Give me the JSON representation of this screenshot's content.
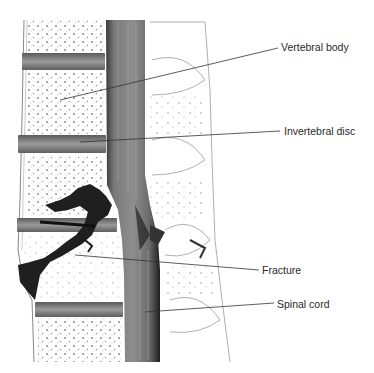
{
  "figure": {
    "labels": [
      {
        "id": "vertebral-body",
        "text": "Vertebral body",
        "x": 281,
        "y": 41
      },
      {
        "id": "invertebral-disc",
        "text": "Invertebral disc",
        "x": 284,
        "y": 125
      },
      {
        "id": "fracture",
        "text": "Fracture",
        "x": 262,
        "y": 264
      },
      {
        "id": "spinal-cord",
        "text": "Spinal cord",
        "x": 277,
        "y": 298
      }
    ],
    "colors": {
      "background": "#ffffff",
      "bone": "#fbfbfb",
      "disc": "#8a8a8a",
      "cord": "#6e6e6e",
      "cord_edge": "#2e2e2e",
      "fracture": "#1e1e1e",
      "line": "#333333",
      "text": "#2a2a2a"
    }
  }
}
